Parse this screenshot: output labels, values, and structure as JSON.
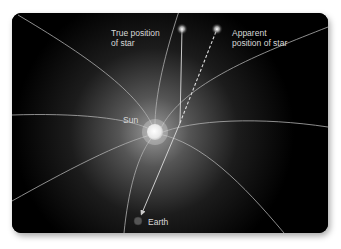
{
  "diagram": {
    "labels": {
      "true_position": [
        "True position",
        "of star"
      ],
      "apparent_position": [
        "Apparent",
        "position of star"
      ],
      "sun": "Sun",
      "earth": "Earth"
    },
    "colors": {
      "background": "#000000",
      "field_lines": "#b8b8b8",
      "sun_glow": "#ffffff",
      "earth": "#555555"
    },
    "objects": [
      "true star",
      "apparent star",
      "Sun",
      "Earth"
    ],
    "rays": [
      {
        "name": "actual light path",
        "style": "solid",
        "from": "true star",
        "to": "Earth",
        "bent_near": "Sun"
      },
      {
        "name": "apparent line of sight",
        "style": "dashed",
        "from": "Earth",
        "to": "apparent star"
      }
    ]
  }
}
